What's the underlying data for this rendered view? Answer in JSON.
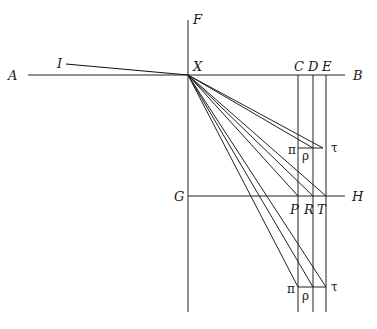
{
  "diagram": {
    "type": "geometric-construction",
    "labels": {
      "A": "A",
      "B": "B",
      "C": "C",
      "D": "D",
      "E": "E",
      "F": "F",
      "G": "G",
      "H": "H",
      "I": "I",
      "X": "X",
      "P": "P",
      "R": "R",
      "T": "T",
      "pi_upper": "π",
      "rho_upper": "ρ",
      "tau_upper": "τ",
      "pi_lower": "π",
      "rho_lower": "ρ",
      "tau_lower": "τ"
    },
    "lines": [
      "A–B horizontal through X",
      "F vertical through X down to bottom",
      "G–H horizontal through P, R, T",
      "I–X oblique line",
      "verticals through C, D, E",
      "rays from X to π, ρ, τ (upper), P, R, T, π, ρ, τ (lower)"
    ]
  }
}
